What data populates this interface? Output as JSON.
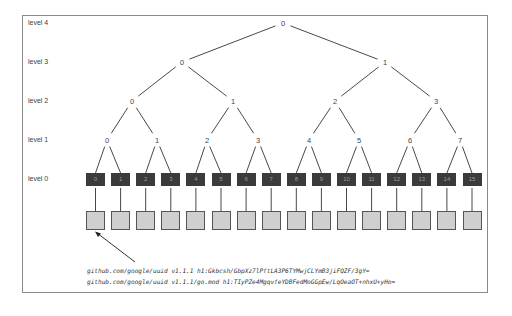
{
  "levels": [
    {
      "label": "level 4",
      "y": 23
    },
    {
      "label": "level 3",
      "y": 62
    },
    {
      "label": "level 2",
      "y": 101
    },
    {
      "label": "level 1",
      "y": 140
    },
    {
      "label": "level 0",
      "y": 179
    }
  ],
  "tree": {
    "level4": [
      {
        "label": "0",
        "x": 283
      }
    ],
    "level3": [
      {
        "label": "0",
        "x": 182
      },
      {
        "label": "1",
        "x": 385
      }
    ],
    "level2": [
      {
        "label": "0",
        "x": 132
      },
      {
        "label": "1",
        "x": 233
      },
      {
        "label": "2",
        "x": 335
      },
      {
        "label": "3",
        "x": 436
      }
    ],
    "level1": [
      {
        "label": "0",
        "x": 107
      },
      {
        "label": "1",
        "x": 157
      },
      {
        "label": "2",
        "x": 207
      },
      {
        "label": "3",
        "x": 258
      },
      {
        "label": "4",
        "x": 309
      },
      {
        "label": "5",
        "x": 359
      },
      {
        "label": "6",
        "x": 410
      },
      {
        "label": "7",
        "x": 460
      }
    ]
  },
  "leaves": [
    "0",
    "1",
    "2",
    "3",
    "4",
    "5",
    "6",
    "7",
    "8",
    "9",
    "10",
    "11",
    "12",
    "13",
    "14",
    "15"
  ],
  "hash_lines": [
    "github.com/google/uuid v1.1.1 h1:Gkbcsh/GbpXz7lPftLA3P6TYMwjCLYmB3jiFQZF/3gY=",
    "github.com/google/uuid v1.1.1/go.mod h1:TIyPZe4MgqvfeYDBFedMoGGpEw/LqOeaOT+nhxU+yHo="
  ],
  "colors": {
    "leaf_fill": "#3b3b3b",
    "data_fill": "#cfcfcf",
    "edge": "#333333",
    "frame": "#8a8a8a"
  }
}
